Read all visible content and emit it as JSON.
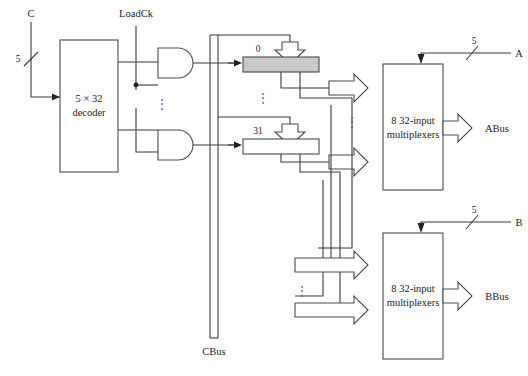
{
  "diagram": {
    "title_note": "",
    "inputs": {
      "c_label": "C",
      "c_width": "5",
      "loadck_label": "LoadCk",
      "a_label": "A",
      "a_width": "5",
      "b_label": "B",
      "b_width": "5"
    },
    "decoder": {
      "line1": "5 × 32",
      "line2": "decoder"
    },
    "registers": {
      "first_label": "0",
      "last_label": "31",
      "ellipsis": "⋮"
    },
    "mux_a": {
      "line1": "8 32-input",
      "line2": "multiplexers",
      "output_label": "ABus"
    },
    "mux_b": {
      "line1": "8 32-input",
      "line2": "multiplexers",
      "output_label": "BBus"
    },
    "buses": {
      "cbus_label": "CBus"
    },
    "ellipsis_glyph": "⋮",
    "colors": {
      "line": "#4a4a4a",
      "wire": "#3a3a3a",
      "shaded_register": "#c9c9c9",
      "text": "#1a1a1a",
      "background": "#ffffff"
    }
  }
}
